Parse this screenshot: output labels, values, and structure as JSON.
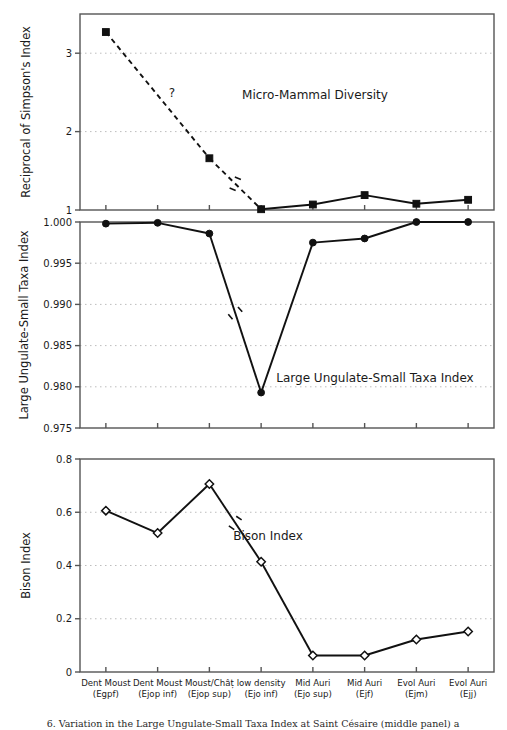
{
  "figure": {
    "background": "#ffffff",
    "line_color": "#111111",
    "grid_color": "#bdbdbd",
    "axis_color": "#555555",
    "caption_partial": "6. Variation in the Large Ungulate-Small Taxa Index at Saint Césaire (middle panel) a"
  },
  "categories": [
    {
      "line1": "Dent Moust",
      "line2": "(Egpf)"
    },
    {
      "line1": "Dent Moust",
      "line2": "(Ejop inf)"
    },
    {
      "line1": "Moust/Châț",
      "line2": "(Ejop sup)"
    },
    {
      "line1": "low density",
      "line2": "(Ejo inf)"
    },
    {
      "line1": "Mid Auri",
      "line2": "(Ejo sup)"
    },
    {
      "line1": "Mid Auri",
      "line2": "(Ejf)"
    },
    {
      "line1": "Evol Auri",
      "line2": "(Ejm)"
    },
    {
      "line1": "Evol Auri",
      "line2": "(Ejj)"
    }
  ],
  "chart_data": [
    {
      "type": "line",
      "panel": "top",
      "title": "Micro-Mammal Diversity",
      "ylabel": "Reciprocal of Simpson's Index",
      "xlabel": "",
      "ylim": [
        1,
        3.5
      ],
      "yticks": [
        1,
        2,
        3
      ],
      "ytick_labels": [
        "1",
        "2",
        "3"
      ],
      "grid": true,
      "marker": "filled-square",
      "annotation": "?",
      "has_break_mark": true,
      "dashed_segments": [
        [
          0,
          1
        ],
        [
          1,
          2
        ]
      ],
      "categories": [
        "Dent Moust (Egpf)",
        "Dent Moust (Ejop inf)",
        "Moust/Châț (Ejop sup)",
        "low density (Ejo inf)",
        "Mid Auri (Ejo sup)",
        "Mid Auri (Ejf)",
        "Evol Auri (Ejm)",
        "Evol Auri (Ejj)"
      ],
      "x_indices": [
        0,
        2,
        3,
        4,
        5,
        6,
        7
      ],
      "values": [
        3.27,
        1.66,
        1.01,
        1.07,
        1.19,
        1.08,
        1.13
      ]
    },
    {
      "type": "line",
      "panel": "middle",
      "title": "Large Ungulate-Small Taxa Index",
      "ylabel": "Large Ungulate-Small Taxa Index",
      "xlabel": "",
      "ylim": [
        0.975,
        1.0
      ],
      "yticks": [
        0.975,
        0.98,
        0.985,
        0.99,
        0.995,
        1.0
      ],
      "ytick_labels": [
        "0.975",
        "0.980",
        "0.985",
        "0.990",
        "0.995",
        "1.000"
      ],
      "grid": true,
      "marker": "filled-circle",
      "has_break_mark": true,
      "categories": [
        "Dent Moust (Egpf)",
        "Dent Moust (Ejop inf)",
        "Moust/Châț (Ejop sup)",
        "low density (Ejo inf)",
        "Mid Auri (Ejo sup)",
        "Mid Auri (Ejf)",
        "Evol Auri (Ejm)",
        "Evol Auri (Ejj)"
      ],
      "values": [
        0.9998,
        0.9999,
        0.9986,
        0.9793,
        0.9975,
        0.998,
        1.0,
        1.0
      ]
    },
    {
      "type": "line",
      "panel": "bottom",
      "title": "Bison Index",
      "ylabel": "Bison Index",
      "xlabel": "",
      "ylim": [
        0,
        0.8
      ],
      "yticks": [
        0,
        0.2,
        0.4,
        0.6,
        0.8
      ],
      "ytick_labels": [
        "0",
        "0.2",
        "0.4",
        "0.6",
        "0.8"
      ],
      "grid": true,
      "marker": "open-diamond",
      "has_break_mark": true,
      "categories": [
        "Dent Moust (Egpf)",
        "Dent Moust (Ejop inf)",
        "Moust/Châț (Ejop sup)",
        "low density (Ejo inf)",
        "Mid Auri (Ejo sup)",
        "Mid Auri (Ejf)",
        "Evol Auri (Ejm)",
        "Evol Auri (Ejj)"
      ],
      "values": [
        0.606,
        0.522,
        0.706,
        0.414,
        0.062,
        0.062,
        0.122,
        0.152
      ]
    }
  ]
}
